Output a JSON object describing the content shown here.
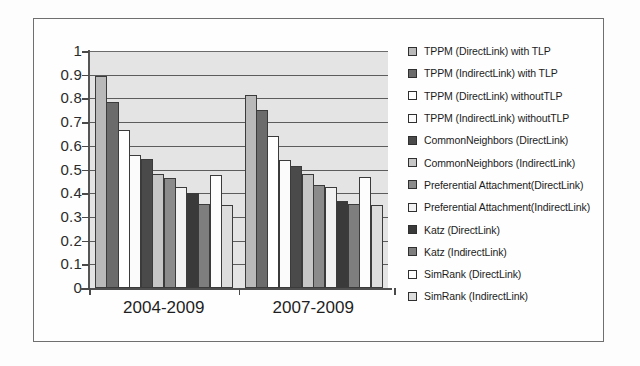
{
  "chart_data": {
    "type": "bar",
    "title": "",
    "xlabel": "",
    "ylabel": "",
    "ylim": [
      0,
      1
    ],
    "ytick_labels": [
      "1",
      "0.9",
      "0.8",
      "0.7",
      "0.6",
      "0.5",
      "0.4",
      "0.3",
      "0.2",
      "0.1",
      "0"
    ],
    "ytick_values": [
      1,
      0.9,
      0.8,
      0.7,
      0.6,
      0.5,
      0.4,
      0.3,
      0.2,
      0.1,
      0
    ],
    "grid": true,
    "legend_position": "right",
    "categories": [
      "2004-2009",
      "2007-2009"
    ],
    "series": [
      {
        "name": "TPPM (DirectLink) with TLP",
        "values": [
          0.895,
          0.815
        ],
        "swatch": "#b9b9b9"
      },
      {
        "name": "TPPM (IndirectLink) with TLP",
        "values": [
          0.785,
          0.75
        ],
        "swatch": "#6b6b6b"
      },
      {
        "name": "TPPM (DirectLink) withoutTLP",
        "values": [
          0.665,
          0.64
        ],
        "swatch": "#ffffff"
      },
      {
        "name": "TPPM (IndirectLink) withoutTLP",
        "values": [
          0.56,
          0.54
        ],
        "swatch": "#fbfbfb"
      },
      {
        "name": "CommonNeighbors (DirectLink)",
        "values": [
          0.545,
          0.515
        ],
        "swatch": "#4a4a4a"
      },
      {
        "name": "CommonNeighbors (IndirectLink)",
        "values": [
          0.48,
          0.48
        ],
        "swatch": "#c6c6c6"
      },
      {
        "name": "Preferential Attachment(DirectLink)",
        "values": [
          0.465,
          0.435
        ],
        "swatch": "#8b8b8b"
      },
      {
        "name": "Preferential Attachment(IndirectLink)",
        "values": [
          0.425,
          0.425
        ],
        "swatch": "#f2f2f2"
      },
      {
        "name": "Katz (DirectLink)",
        "values": [
          0.4,
          0.365
        ],
        "swatch": "#3a3a3a"
      },
      {
        "name": "Katz (IndirectLink)",
        "values": [
          0.355,
          0.355
        ],
        "swatch": "#7e7e7e"
      },
      {
        "name": "SimRank (DirectLink)",
        "values": [
          0.475,
          0.47
        ],
        "swatch": "#fdfdfd"
      },
      {
        "name": "SimRank (IndirectLink)",
        "values": [
          0.35,
          0.35
        ],
        "swatch": "#dcdcdc"
      }
    ]
  }
}
